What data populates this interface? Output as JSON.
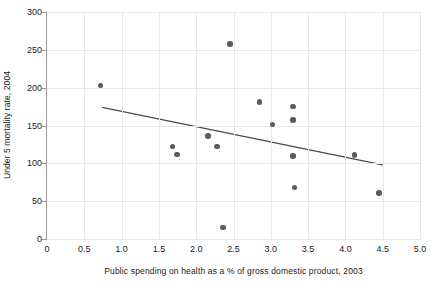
{
  "chart_data": {
    "type": "scatter",
    "title": "",
    "xlabel": "Public spending on health as a % of gross domestic product, 2003",
    "ylabel": "Under 5 mortality rate, 2004",
    "xlim": [
      0,
      5.0
    ],
    "ylim": [
      0,
      300
    ],
    "xticks": [
      "0",
      "0.5",
      "1.0",
      "1.5",
      "2.0",
      "2.5",
      "3.0",
      "3.5",
      "4.0",
      "4.5",
      "5.0"
    ],
    "xtick_values": [
      0,
      0.5,
      1.0,
      1.5,
      2.0,
      2.5,
      3.0,
      3.5,
      4.0,
      4.5,
      5.0
    ],
    "yticks": [
      "0",
      "50",
      "100",
      "150",
      "200",
      "250",
      "300"
    ],
    "ytick_values": [
      0,
      50,
      100,
      150,
      200,
      250,
      300
    ],
    "grid": true,
    "legend": null,
    "marker_color": "#5a5a5f",
    "trendline_color": "#4a4a4a",
    "points": [
      {
        "x": 0.72,
        "y": 203
      },
      {
        "x": 1.68,
        "y": 122
      },
      {
        "x": 1.74,
        "y": 112
      },
      {
        "x": 2.16,
        "y": 136
      },
      {
        "x": 2.28,
        "y": 122
      },
      {
        "x": 2.36,
        "y": 15
      },
      {
        "x": 2.45,
        "y": 258
      },
      {
        "x": 2.85,
        "y": 181
      },
      {
        "x": 3.02,
        "y": 151
      },
      {
        "x": 3.3,
        "y": 175
      },
      {
        "x": 3.3,
        "y": 157
      },
      {
        "x": 3.3,
        "y": 110
      },
      {
        "x": 3.32,
        "y": 68
      },
      {
        "x": 4.12,
        "y": 111
      },
      {
        "x": 4.45,
        "y": 61
      }
    ],
    "trendline": {
      "x_start": 0.74,
      "y_start": 174,
      "x_end": 4.5,
      "y_end": 98
    }
  }
}
